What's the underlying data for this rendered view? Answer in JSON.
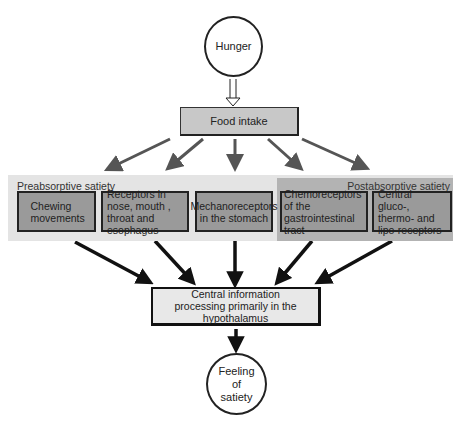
{
  "diagram": {
    "start_node": {
      "label": "Hunger"
    },
    "food_intake": {
      "label": "Food intake"
    },
    "groups": {
      "preabsorptive": {
        "label": "Preabsorptive satiety"
      },
      "postabsorptive": {
        "label": "Postabsorptive satiety"
      }
    },
    "receptors": [
      {
        "label": "Chewing movements",
        "group": "preabsorptive"
      },
      {
        "label": "Receptors in nose, mouth , throat and esophagus",
        "group": "preabsorptive"
      },
      {
        "label": "Mechanoreceptors in the stomach",
        "group": "preabsorptive"
      },
      {
        "label": "Chemoreceptors of the gastrointestinal tract",
        "group": "postabsorptive"
      },
      {
        "label": "Central gluco-, thermo- and lipo-receptors",
        "group": "postabsorptive"
      }
    ],
    "central": {
      "label": "Central information processing primarily in the hypothalamus"
    },
    "end_node": {
      "label": "Feeling of satiety"
    },
    "colors": {
      "arrow_gray": "#555555",
      "arrow_black": "#111111",
      "receptor_box": "#9a9a9a",
      "pre_band": "#e4e4e4",
      "post_band": "#b3b3b3",
      "food_box": "#c8c8c8",
      "central_box": "#e8e8e8"
    }
  }
}
